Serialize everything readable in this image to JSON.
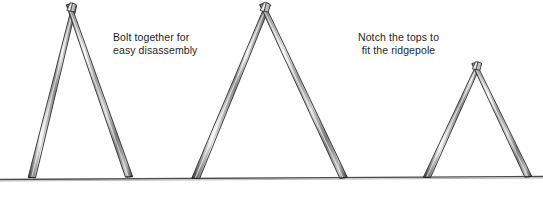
{
  "illustration": {
    "title": "A-frame tent supports on ground line",
    "background_color": "#ffffff",
    "ink_color": "#231f20",
    "pole_edge_color": "#2b2b2b",
    "pole_light_color": "#f2f2f2",
    "pole_mid_color": "#9a9a9a",
    "pole_shadow_color": "#6e6e6e",
    "ground_color": "#555555"
  },
  "captions": {
    "bolt": {
      "line1": "Bolt together for",
      "line2": "easy disassembly"
    },
    "notch": {
      "line1": "Notch the tops to",
      "line2": "fit the ridgepole"
    }
  },
  "ground": {
    "label": "ground-line",
    "x1": 0,
    "y1": 179,
    "x2": 543,
    "y2": 176
  },
  "frames": [
    {
      "name": "a-frame-left",
      "apex_x": 70,
      "apex_y": 9,
      "left_foot_x": 29,
      "right_foot_x": 129,
      "foot_y": 177,
      "pole_width": 7
    },
    {
      "name": "a-frame-center",
      "apex_x": 264,
      "apex_y": 8,
      "left_foot_x": 192,
      "right_foot_x": 344,
      "foot_y": 178,
      "pole_width": 7.5
    },
    {
      "name": "a-frame-right",
      "apex_x": 476,
      "apex_y": 67,
      "left_foot_x": 424,
      "right_foot_x": 529,
      "foot_y": 177,
      "pole_width": 7
    }
  ]
}
